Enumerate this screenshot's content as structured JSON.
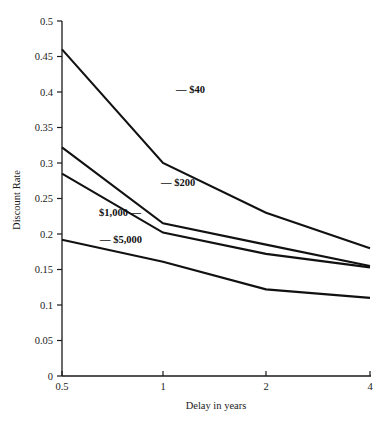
{
  "chart_data": {
    "type": "line",
    "title": "",
    "xlabel": "Delay in years",
    "ylabel": "Discount Rate",
    "x": [
      0.5,
      1,
      2,
      4
    ],
    "x_tick_labels": [
      "0.5",
      "1",
      "2",
      "4"
    ],
    "xlim": [
      0.5,
      4
    ],
    "x_scale": "ordinal",
    "ylim": [
      0,
      0.5
    ],
    "y_ticks": [
      0,
      0.05,
      0.1,
      0.15,
      0.2,
      0.25,
      0.3,
      0.35,
      0.4,
      0.45,
      0.5
    ],
    "y_tick_labels": [
      "0",
      "0.05",
      "0.1",
      "0.15",
      "0.2",
      "0.25",
      "0.3",
      "0.35",
      "0.4",
      "0.45",
      "0.5"
    ],
    "grid": false,
    "legend_position": "inline-annotations",
    "series": [
      {
        "name": "$40",
        "label": "— $40",
        "label_side": "lead",
        "values": [
          0.46,
          0.3,
          0.23,
          0.18
        ]
      },
      {
        "name": "$200",
        "label": "— $200",
        "label_side": "lead",
        "values": [
          0.322,
          0.215,
          0.185,
          0.155
        ]
      },
      {
        "name": "$1,000",
        "label": "$1,000 —",
        "label_side": "trail",
        "values": [
          0.285,
          0.202,
          0.172,
          0.153
        ]
      },
      {
        "name": "$5,000",
        "label": "— $5,000",
        "label_side": "lead",
        "values": [
          0.192,
          0.161,
          0.122,
          0.11
        ]
      }
    ],
    "colors": {
      "line": "#111111",
      "axis": "#1a1a1a",
      "background": "#ffffff"
    }
  },
  "annotations": {
    "s40": {
      "text": "— $40",
      "x": 176,
      "y": 93
    },
    "s200": {
      "text": "— $200",
      "x": 161,
      "y": 186
    },
    "s1000": {
      "text": "$1,000 —",
      "x": 141,
      "y": 216
    },
    "s5000": {
      "text": "— $5,000",
      "x": 100,
      "y": 243
    }
  },
  "labels": {
    "y_axis_title": "Discount Rate",
    "x_axis_title": "Delay in years"
  }
}
